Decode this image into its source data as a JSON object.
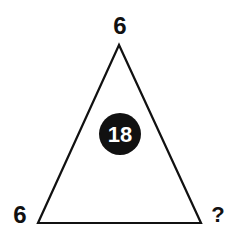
{
  "puzzle": {
    "shape": "triangle",
    "vertices": {
      "top": {
        "label": "6"
      },
      "bottom_left": {
        "label": "6"
      },
      "bottom_right": {
        "label": "?"
      }
    },
    "center": {
      "label": "18"
    }
  },
  "colors": {
    "line": "#111111",
    "circle_fill": "#111111",
    "circle_text": "#ffffff",
    "background": "#ffffff"
  }
}
